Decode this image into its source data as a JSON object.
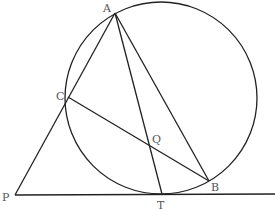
{
  "diagram": {
    "type": "geometry",
    "circle": {
      "cx": 161,
      "cy": 98,
      "r": 96
    },
    "points": {
      "A": {
        "label": "A",
        "x": 115,
        "y": 13,
        "lx": 103,
        "ly": 12
      },
      "C": {
        "label": "C",
        "x": 68,
        "y": 97,
        "lx": 56,
        "ly": 98
      },
      "P": {
        "label": "P",
        "x": 15,
        "y": 195,
        "lx": 2,
        "ly": 201
      },
      "T": {
        "label": "T",
        "x": 162,
        "y": 194,
        "lx": 158,
        "ly": 209
      },
      "B": {
        "label": "B",
        "x": 209,
        "y": 181,
        "lx": 212,
        "ly": 191
      },
      "Q": {
        "label": "Q",
        "x": 151,
        "y": 147,
        "lx": 152,
        "ly": 143
      }
    },
    "segments": [
      [
        "P",
        "A"
      ],
      [
        "A",
        "T"
      ],
      [
        "A",
        "B"
      ],
      [
        "C",
        "B"
      ],
      [
        "P",
        "T-ext"
      ]
    ]
  }
}
